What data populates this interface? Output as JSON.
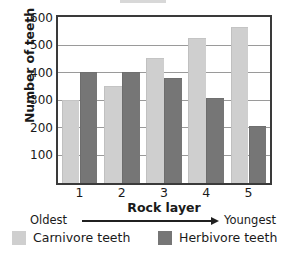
{
  "chart_data": {
    "type": "bar",
    "title": "",
    "xlabel": "Rock layer",
    "ylabel": "Number of teeth",
    "categories": [
      "1",
      "2",
      "3",
      "4",
      "5"
    ],
    "series": [
      {
        "name": "Carnivore teeth",
        "color": "#cfcfcf",
        "values": [
          300,
          350,
          450,
          525,
          565
        ]
      },
      {
        "name": "Herbivore teeth",
        "color": "#767676",
        "values": [
          400,
          400,
          380,
          305,
          205
        ]
      }
    ],
    "ylim": [
      0,
      600
    ],
    "yticks": [
      100,
      200,
      300,
      400,
      500,
      600
    ],
    "ytick_labels": [
      "100",
      "200",
      "300",
      "400",
      "500",
      "600"
    ],
    "grid": true,
    "legend_position": "bottom",
    "annotations": {
      "axis_direction_left": "Oldest",
      "axis_direction_right": "Youngest",
      "axis_direction_arrow": "right-arrow"
    }
  },
  "axis": {
    "y_title": "Number of teeth",
    "x_title": "Rock layer"
  },
  "legend": {
    "items": [
      {
        "label": "Carnivore teeth",
        "color": "#cfcfcf",
        "swatch": "carnivore-swatch"
      },
      {
        "label": "Herbivore teeth",
        "color": "#767676",
        "swatch": "herbivore-swatch"
      }
    ]
  }
}
